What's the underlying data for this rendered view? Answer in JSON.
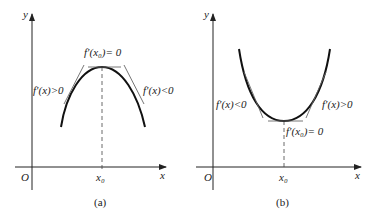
{
  "panels": [
    {
      "caption": "(a)",
      "axis_x": "x",
      "axis_y": "y",
      "origin": "O",
      "x0": "x₀",
      "label_top": "f′(x₀)= 0",
      "label_left": "f′(x)>0",
      "label_right": "f′(x)<0",
      "curve": "concave-down (maximum at x₀)"
    },
    {
      "caption": "(b)",
      "axis_x": "x",
      "axis_y": "y",
      "origin": "O",
      "x0": "x₀",
      "label_bottom": "f′(x₀)= 0",
      "label_left": "f′(x)<0",
      "label_right": "f′(x)>0",
      "curve": "concave-up (minimum at x₀)"
    }
  ],
  "colors": {
    "ink": "#222222",
    "tangent": "#666666"
  }
}
